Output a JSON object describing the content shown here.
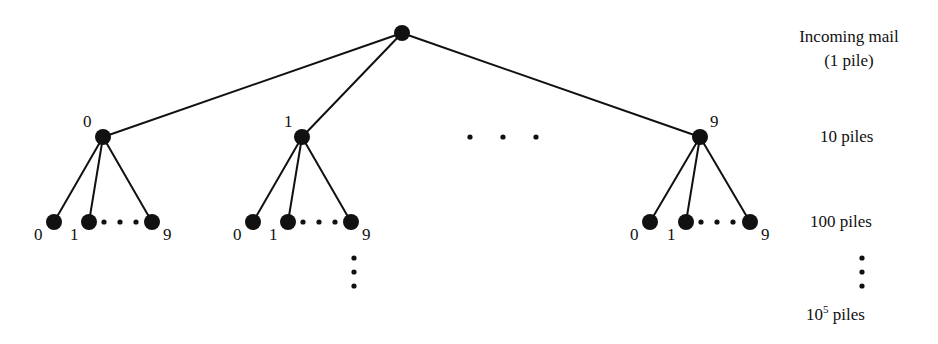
{
  "figure": {
    "background_color": "#ffffff",
    "ink_color": "#111111"
  },
  "tree": {
    "root": {
      "x": 402,
      "y": 33,
      "r": 8
    },
    "level2": [
      {
        "id": "L2-0",
        "label": "0",
        "x": 103,
        "y": 137,
        "r": 8,
        "label_x": 83,
        "label_y": 113
      },
      {
        "id": "L2-1",
        "label": "1",
        "x": 302,
        "y": 137,
        "r": 8,
        "label_x": 284,
        "label_y": 113
      },
      {
        "id": "L2-9",
        "label": "9",
        "x": 700,
        "y": 137,
        "r": 8,
        "label_x": 710,
        "label_y": 113
      }
    ],
    "level2_ellipsis": {
      "dots": 3,
      "x_start": 470,
      "x_step": 33,
      "y": 137,
      "r": 2.6
    },
    "leaf_groups": [
      {
        "parent": "L2-0",
        "leaves": [
          {
            "label": "0",
            "x": 54,
            "y": 222,
            "r": 8,
            "label_x": 34,
            "label_y": 226
          },
          {
            "label": "1",
            "x": 89,
            "y": 222,
            "r": 8,
            "label_x": 70,
            "label_y": 226
          },
          {
            "label": "9",
            "x": 152,
            "y": 222,
            "r": 8,
            "label_x": 163,
            "label_y": 226
          }
        ],
        "ellipsis": {
          "dots": 3,
          "x_start": 104,
          "x_step": 16,
          "y": 222,
          "r": 2.6
        }
      },
      {
        "parent": "L2-1",
        "leaves": [
          {
            "label": "0",
            "x": 253,
            "y": 222,
            "r": 8,
            "label_x": 233,
            "label_y": 226
          },
          {
            "label": "1",
            "x": 288,
            "y": 222,
            "r": 8,
            "label_x": 269,
            "label_y": 226
          },
          {
            "label": "9",
            "x": 351,
            "y": 222,
            "r": 8,
            "label_x": 362,
            "label_y": 226
          }
        ],
        "ellipsis": {
          "dots": 3,
          "x_start": 303,
          "x_step": 16,
          "y": 222,
          "r": 2.6
        }
      },
      {
        "parent": "L2-9",
        "leaves": [
          {
            "label": "0",
            "x": 650,
            "y": 222,
            "r": 8,
            "label_x": 630,
            "label_y": 226
          },
          {
            "label": "1",
            "x": 686,
            "y": 222,
            "r": 8,
            "label_x": 667,
            "label_y": 226
          },
          {
            "label": "9",
            "x": 750,
            "y": 222,
            "r": 8,
            "label_x": 761,
            "label_y": 226
          }
        ],
        "ellipsis": {
          "dots": 3,
          "x_start": 701,
          "x_step": 16,
          "y": 222,
          "r": 2.6
        }
      }
    ],
    "tree_vertical_ellipsis": {
      "dots": 3,
      "x": 354,
      "y_start": 258,
      "y_step": 14,
      "r": 2.6
    },
    "edge_width": 2.0
  },
  "side_labels": {
    "incoming_line1": "Incoming mail",
    "incoming_line2": "(1 pile)",
    "level2": "10 piles",
    "level3": "100 piles",
    "level_last_base": "10",
    "level_last_exp": "5",
    "level_last_suffix": " piles"
  },
  "side_vertical_ellipsis": {
    "dots": 3,
    "x": 862,
    "y_start": 258,
    "y_step": 14,
    "r": 2.6
  }
}
